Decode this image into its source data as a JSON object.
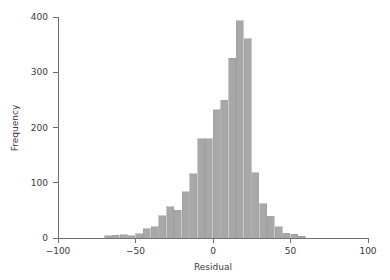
{
  "chart_data": {
    "type": "bar",
    "subtype": "histogram",
    "title": "",
    "xlabel": "Residual",
    "ylabel": "Frequency",
    "xlim": [
      -100,
      100
    ],
    "ylim": [
      0,
      400
    ],
    "xticks": [
      -100,
      -50,
      0,
      50,
      100
    ],
    "xtick_labels": [
      "−100",
      "−50",
      "0",
      "50",
      "100"
    ],
    "yticks": [
      0,
      100,
      200,
      300,
      400
    ],
    "ytick_labels": [
      "0",
      "100",
      "200",
      "300",
      "400"
    ],
    "grid": false,
    "legend": false,
    "legend_position": "none",
    "bin_width": 5,
    "bin_starts": [
      -70,
      -65,
      -60,
      -55,
      -50,
      -45,
      -40,
      -35,
      -30,
      -25,
      -20,
      -15,
      -10,
      -5,
      0,
      5,
      10,
      15,
      20,
      25,
      30,
      35,
      40,
      45,
      50,
      55
    ],
    "bin_centers": [
      -67.5,
      -62.5,
      -57.5,
      -52.5,
      -47.5,
      -42.5,
      -37.5,
      -32.5,
      -27.5,
      -22.5,
      -17.5,
      -12.5,
      -7.5,
      -2.5,
      2.5,
      7.5,
      12.5,
      17.5,
      22.5,
      27.5,
      32.5,
      37.5,
      42.5,
      47.5,
      52.5,
      57.5
    ],
    "categories": [
      "-70",
      "-65",
      "-60",
      "-55",
      "-50",
      "-45",
      "-40",
      "-35",
      "-30",
      "-25",
      "-20",
      "-15",
      "-10",
      "-5",
      "0",
      "5",
      "10",
      "15",
      "20",
      "25",
      "30",
      "35",
      "40",
      "45",
      "50",
      "55"
    ],
    "values": [
      4,
      5,
      6,
      4,
      8,
      17,
      20,
      40,
      57,
      50,
      84,
      116,
      180,
      180,
      232,
      249,
      325,
      393,
      361,
      118,
      62,
      39,
      20,
      9,
      7,
      3
    ],
    "series": [
      {
        "name": "Frequency",
        "values": [
          4,
          5,
          6,
          4,
          8,
          17,
          20,
          40,
          57,
          50,
          84,
          116,
          180,
          180,
          232,
          249,
          325,
          393,
          361,
          118,
          62,
          39,
          20,
          9,
          7,
          3
        ]
      }
    ],
    "peak_value": 393,
    "peak_bin": "10 to 15",
    "colors": {
      "bar_fill": "#a8a8a8",
      "bar_edge": "#9a9a9a",
      "axis": "#6f6f6f",
      "text": "#3a3a3a",
      "background": "#ffffff"
    }
  },
  "axes": {
    "x_title": "Residual",
    "y_title": "Frequency"
  }
}
